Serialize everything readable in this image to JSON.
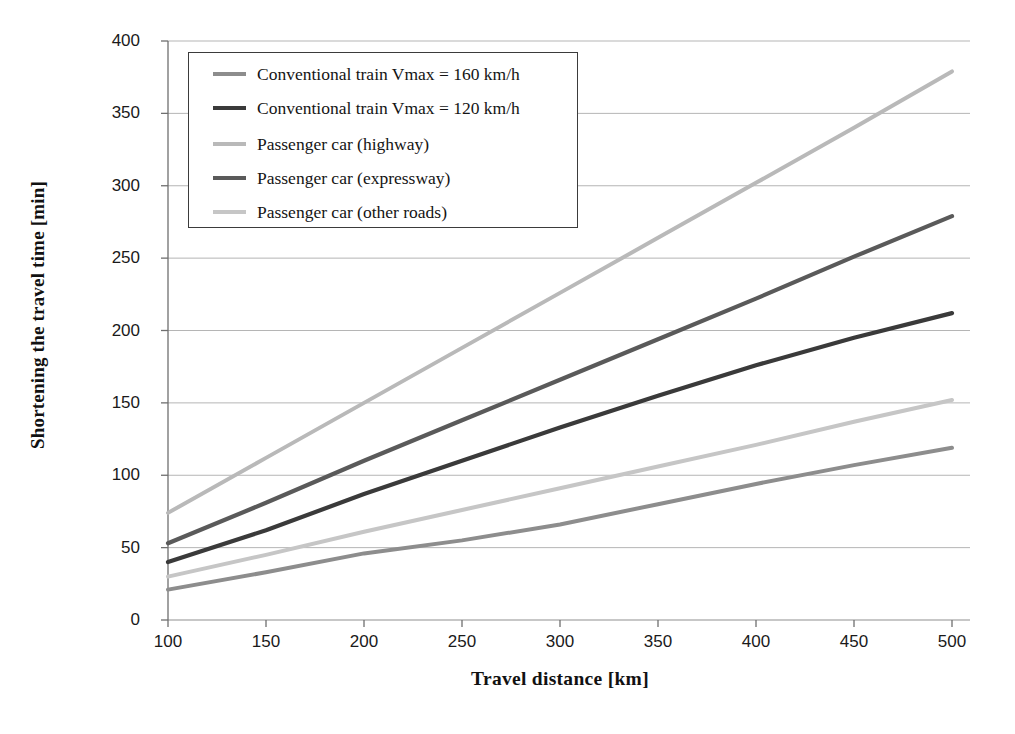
{
  "chart_data": {
    "type": "line",
    "title": "",
    "xlabel": "Travel distance [km]",
    "ylabel": "Shortening the travel time [min]",
    "x": [
      100,
      150,
      200,
      250,
      300,
      350,
      400,
      450,
      500
    ],
    "xlim": [
      100,
      500
    ],
    "ylim": [
      0,
      400
    ],
    "xticks": [
      "100",
      "150",
      "200",
      "250",
      "300",
      "350",
      "400",
      "450",
      "500"
    ],
    "yticks": [
      "0",
      "50",
      "100",
      "150",
      "200",
      "250",
      "300",
      "350",
      "400"
    ],
    "grid": "horizontal",
    "legend_position": "upper-left-inside",
    "series": [
      {
        "name": "Conventional train Vmax = 160 km/h",
        "color": "#8d8d8d",
        "width": 4.0,
        "values": [
          21,
          33,
          46,
          55,
          66,
          80,
          94,
          107,
          119
        ]
      },
      {
        "name": "Conventional train Vmax = 120 km/h",
        "color": "#3a3a3a",
        "width": 4.2,
        "values": [
          40,
          62,
          87,
          110,
          133,
          155,
          176,
          195,
          212
        ]
      },
      {
        "name": "Passenger car (highway)",
        "color": "#b9b9b9",
        "width": 4.0,
        "values": [
          74,
          112,
          150,
          188,
          226,
          264,
          302,
          340,
          379
        ]
      },
      {
        "name": "Passenger car (expressway)",
        "color": "#5a5a5a",
        "width": 4.2,
        "values": [
          53,
          81,
          110,
          138,
          166,
          194,
          222,
          251,
          279
        ]
      },
      {
        "name": "Passenger car (other roads)",
        "color": "#c6c6c6",
        "width": 4.0,
        "values": [
          30,
          45,
          61,
          76,
          91,
          106,
          121,
          137,
          152
        ]
      }
    ]
  },
  "axes": {
    "axis_color": "#6f6f6f",
    "grid_color": "#b5b5b5"
  }
}
